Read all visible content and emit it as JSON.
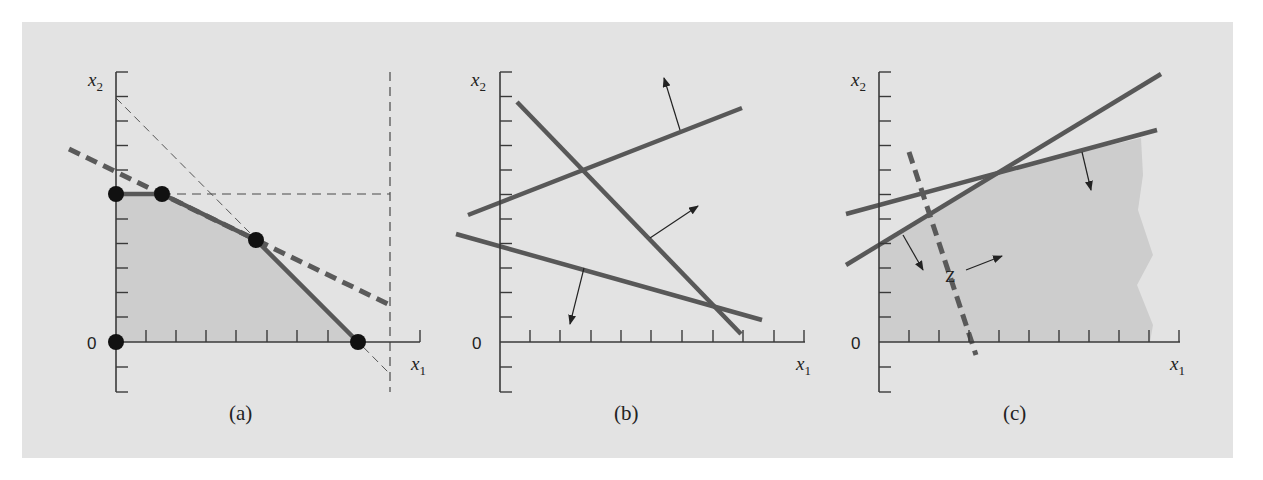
{
  "figure": {
    "background_color": "#e3e3e3",
    "line_color": "#585858",
    "feasible_fill": "#cdcdcd",
    "vertex_color": "#111111"
  },
  "panels": [
    {
      "id": "a",
      "caption": "(a)",
      "origin_label": "0",
      "x_axis_label": "x",
      "x_axis_sub": "1",
      "y_axis_label": "x",
      "y_axis_sub": "2",
      "description": "Feasible region with unique optimal solution; five vertices marked",
      "vertices": 5
    },
    {
      "id": "b",
      "caption": "(b)",
      "origin_label": "0",
      "x_axis_label": "x",
      "x_axis_sub": "1",
      "y_axis_label": "x",
      "y_axis_sub": "2",
      "description": "Three constraints with no feasible region (arrows indicate feasible side)"
    },
    {
      "id": "c",
      "caption": "(c)",
      "origin_label": "0",
      "x_axis_label": "x",
      "x_axis_sub": "1",
      "y_axis_label": "x",
      "y_axis_sub": "2",
      "objective_label": "Z",
      "description": "Unbounded feasible region; objective Z increases to the right"
    }
  ]
}
